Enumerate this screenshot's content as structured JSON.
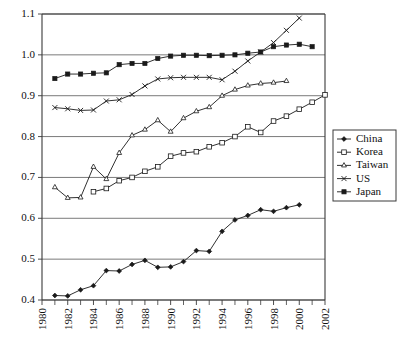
{
  "chart_data": {
    "type": "line",
    "title": "",
    "subtitle": "",
    "xlabel": "",
    "ylabel": "",
    "xlim": [
      1980,
      2002
    ],
    "ylim": [
      0.4,
      1.1
    ],
    "grid": true,
    "grid_axis": "y",
    "legend_position": "right",
    "y_ticks": [
      "0.4",
      "0.5",
      "0.6",
      "0.7",
      "0.8",
      "0.9",
      "1.0",
      "1.1"
    ],
    "y_tick_values": [
      0.4,
      0.5,
      0.6,
      0.7,
      0.8,
      0.9,
      1.0,
      1.1
    ],
    "x_ticks": [
      "1980",
      "1982",
      "1984",
      "1986",
      "1988",
      "1990",
      "1992",
      "1994",
      "1996",
      "1998",
      "2000",
      "2002"
    ],
    "x_tick_values": [
      1980,
      1982,
      1984,
      1986,
      1988,
      1990,
      1992,
      1994,
      1996,
      1998,
      2000,
      2002
    ],
    "x_minor_tick_values": [
      1981,
      1983,
      1985,
      1987,
      1989,
      1991,
      1993,
      1995,
      1997,
      1999,
      2001
    ],
    "series": [
      {
        "name": "China",
        "marker": "filled-diamond",
        "x": [
          1981,
          1982,
          1983,
          1984,
          1985,
          1986,
          1987,
          1988,
          1989,
          1990,
          1991,
          1992,
          1993,
          1994,
          1995,
          1996,
          1997,
          1998,
          1999,
          2000
        ],
        "values": [
          0.411,
          0.41,
          0.425,
          0.435,
          0.472,
          0.471,
          0.487,
          0.497,
          0.48,
          0.481,
          0.494,
          0.521,
          0.519,
          0.568,
          0.596,
          0.607,
          0.621,
          0.617,
          0.626,
          0.633
        ]
      },
      {
        "name": "Korea",
        "marker": "open-square",
        "x": [
          1984,
          1985,
          1986,
          1987,
          1988,
          1989,
          1990,
          1991,
          1992,
          1993,
          1994,
          1995,
          1996,
          1997,
          1998,
          1999,
          2000,
          2001,
          2002
        ],
        "values": [
          0.665,
          0.673,
          0.692,
          0.7,
          0.715,
          0.726,
          0.752,
          0.76,
          0.763,
          0.775,
          0.785,
          0.8,
          0.824,
          0.81,
          0.838,
          0.85,
          0.867,
          0.884,
          0.902
        ]
      },
      {
        "name": "Taiwan",
        "marker": "open-triangle",
        "x": [
          1981,
          1982,
          1983,
          1984,
          1985,
          1986,
          1987,
          1988,
          1989,
          1990,
          1991,
          1992,
          1993,
          1994,
          1995,
          1996,
          1997,
          1998,
          1999
        ],
        "values": [
          0.676,
          0.65,
          0.651,
          0.726,
          0.696,
          0.76,
          0.803,
          0.817,
          0.84,
          0.812,
          0.845,
          0.862,
          0.872,
          0.9,
          0.915,
          0.925,
          0.93,
          0.932,
          0.936
        ]
      },
      {
        "name": "US",
        "marker": "cross",
        "x": [
          1981,
          1982,
          1983,
          1984,
          1985,
          1986,
          1987,
          1988,
          1989,
          1990,
          1991,
          1992,
          1993,
          1994,
          1995,
          1996,
          1997,
          1998,
          1999,
          2000
        ],
        "values": [
          0.871,
          0.868,
          0.864,
          0.865,
          0.887,
          0.89,
          0.903,
          0.924,
          0.941,
          0.944,
          0.945,
          0.945,
          0.945,
          0.939,
          0.96,
          0.985,
          1.007,
          1.03,
          1.06,
          1.09
        ]
      },
      {
        "name": "Japan",
        "marker": "filled-square",
        "x": [
          1981,
          1982,
          1983,
          1984,
          1985,
          1986,
          1987,
          1988,
          1989,
          1990,
          1991,
          1992,
          1993,
          1994,
          1995,
          1996,
          1997,
          1998,
          1999,
          2000,
          2001
        ],
        "values": [
          0.942,
          0.953,
          0.953,
          0.955,
          0.956,
          0.976,
          0.979,
          0.979,
          0.991,
          0.997,
          0.999,
          0.999,
          0.998,
          0.999,
          1.0,
          1.004,
          1.007,
          1.02,
          1.024,
          1.026,
          1.02
        ]
      }
    ]
  },
  "legend": {
    "entries": [
      {
        "label": "China",
        "marker": "filled-diamond"
      },
      {
        "label": "Korea",
        "marker": "open-square"
      },
      {
        "label": "Taiwan",
        "marker": "open-triangle"
      },
      {
        "label": "US",
        "marker": "cross"
      },
      {
        "label": "Japan",
        "marker": "filled-square"
      }
    ]
  }
}
